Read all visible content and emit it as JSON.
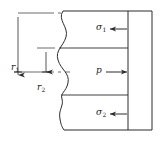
{
  "figure": {
    "kind": "engineering-cross-section-diagram",
    "background_color": "#ffffff",
    "line_color": "#2b2b2b",
    "text_color": "#1a1a1a"
  },
  "labels": {
    "outer_radius": {
      "symbol": "r",
      "subscript": "1",
      "text": "r"
    },
    "inner_radius": {
      "symbol": "r",
      "subscript": "2",
      "text": "r"
    },
    "top_stress": {
      "symbol": "σ",
      "subscript": "1",
      "text": "σ"
    },
    "pressure": {
      "symbol": "p",
      "subscript": "",
      "text": "p"
    },
    "bottom_stress": {
      "symbol": "σ",
      "subscript": "2",
      "text": "σ"
    }
  },
  "label_subscripts": {
    "outer_radius": "1",
    "inner_radius": "2",
    "top_stress": "1",
    "bottom_stress": "2"
  },
  "arrows": {
    "top_stress_direction": "left",
    "pressure_direction": "right",
    "bottom_stress_direction": "left",
    "outer_radius_direction": "down",
    "inner_radius_direction": "down"
  },
  "geometry": {
    "body_left": 62,
    "body_right": 152,
    "body_top": 11,
    "body_bottom": 130,
    "inner_wall_x": 128,
    "divider_top_y": 48,
    "divider_bottom_y": 95,
    "centerline_y": 72,
    "mid_dash_y": 48,
    "break_line": "wavy"
  }
}
